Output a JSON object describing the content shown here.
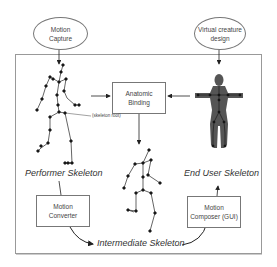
{
  "diagram": {
    "nodes": {
      "motion_capture": "Motion\nCapture",
      "virtual_creature_design": "Virtual creature\ndesign",
      "anatomic_binding": "Anatomic\nBinding",
      "motion_converter": "Motion\nConverter",
      "motion_composer": "Motion\nComposer (GUI)"
    },
    "labels": {
      "performer_skeleton": "Performer Skeleton",
      "end_user_skeleton": "End User Skeleton",
      "intermediate_skeleton": "Intermediate Skeleton",
      "skeleton_root": "(skeleton root)"
    },
    "edges": [
      {
        "from": "Motion Capture",
        "to": "Performer Skeleton"
      },
      {
        "from": "Virtual creature design",
        "to": "End User Skeleton"
      },
      {
        "from": "Performer Skeleton",
        "to": "Anatomic Binding"
      },
      {
        "from": "End User Skeleton",
        "to": "Anatomic Binding"
      },
      {
        "from": "Anatomic Binding",
        "to": "Intermediate Skeleton"
      },
      {
        "from": "Performer Skeleton",
        "to": "Motion Converter"
      },
      {
        "from": "Motion Converter",
        "to": "Intermediate Skeleton"
      },
      {
        "from": "Intermediate Skeleton",
        "to": "Motion Composer (GUI)"
      },
      {
        "from": "Motion Composer (GUI)",
        "to": "End User Skeleton"
      }
    ],
    "colors": {
      "line": "#222222",
      "frame": "#888888",
      "text": "#444444",
      "figure": "#555555"
    }
  }
}
